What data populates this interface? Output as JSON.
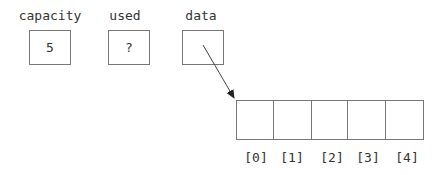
{
  "variables": [
    {
      "name": "capacity",
      "value": "5"
    },
    {
      "name": "used",
      "value": "?"
    },
    {
      "name": "data",
      "value": ""
    }
  ],
  "array": {
    "indices": [
      "[0]",
      "[1]",
      "[2]",
      "[3]",
      "[4]"
    ],
    "cells": [
      "",
      "",
      "",
      "",
      ""
    ]
  },
  "pointer": {
    "from": "data",
    "to": "array[0]"
  }
}
